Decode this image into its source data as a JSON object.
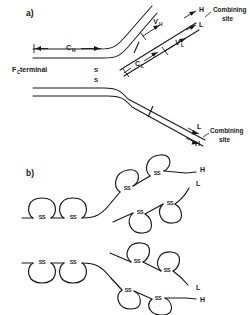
{
  "figure": {
    "background_color": "#ffffff",
    "line_color": "#171717",
    "width": 250,
    "height": 315
  },
  "panel_a": {
    "label": "a)",
    "terminal_label": "F",
    "terminal_label_sub": "C",
    "terminal_label_rest": " terminal",
    "domains": {
      "ch": {
        "main": "C",
        "sub": "H"
      },
      "cl": {
        "main": "C",
        "sub": "L"
      },
      "vh": {
        "main": "V",
        "sub": "H"
      },
      "vl": {
        "main": "V",
        "sub": "L"
      }
    },
    "disulfide_hinge": [
      "S",
      "S"
    ],
    "chain_labels": {
      "upper_heavy": "H",
      "upper_light": "L",
      "lower_light": "L",
      "lower_heavy": "H"
    },
    "combining_site_upper": {
      "line1": "Combining",
      "line2": "site"
    },
    "combining_site_lower": {
      "line1": "Combining",
      "line2": "site"
    }
  },
  "panel_b": {
    "label": "b)",
    "disulfide_label": "SS",
    "upper_arm": {
      "heavy_chain_label": "H",
      "light_chain_label": "L"
    },
    "lower_arm": {
      "light_chain_label": "L",
      "heavy_chain_label": "H"
    },
    "domain_loop_count_fc_upper": 2,
    "domain_loop_count_fc_lower": 2,
    "domain_loop_count_upper_heavy_arm": 2,
    "domain_loop_count_upper_light_arm": 2,
    "domain_loop_count_lower_heavy_arm": 2,
    "domain_loop_count_lower_light_arm": 2
  }
}
